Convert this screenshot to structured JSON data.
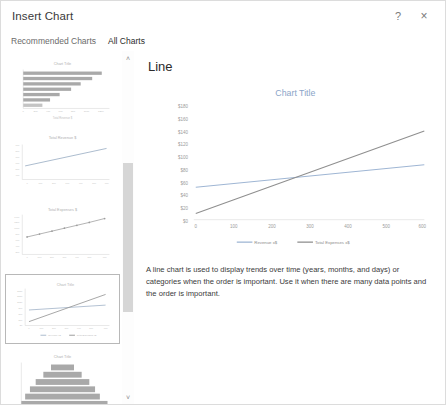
{
  "dialog": {
    "title": "Insert Chart",
    "help_label": "?",
    "close_label": "×"
  },
  "tabs": [
    {
      "label": "Recommended Charts",
      "active": false
    },
    {
      "label": "All Charts",
      "active": true
    }
  ],
  "scrollbar": {
    "up_label": "˄",
    "down_label": "˅"
  },
  "gallery": {
    "thumbnails": [
      {
        "name": "bar-chart-thumbnail",
        "title": "Chart Title",
        "selected": false
      },
      {
        "name": "line-chart-thumbnail",
        "title": "Total Revenue $",
        "selected": false
      },
      {
        "name": "line-markers-chart-thumbnail",
        "title": "Total Expenses $",
        "selected": false
      },
      {
        "name": "line-two-series-chart-thumbnail",
        "title": "Chart Title",
        "selected": true
      },
      {
        "name": "funnel-chart-thumbnail",
        "title": "Chart Title",
        "selected": false
      }
    ]
  },
  "preview": {
    "heading": "Line",
    "description": "A line chart is used to display trends over time (years, months, and days) or categories when the order is important. Use it when there are many data points and the order is important."
  },
  "chart_data": {
    "type": "line",
    "title": "Chart Title",
    "xlabel": "",
    "ylabel": "",
    "x": [
      0,
      100,
      200,
      300,
      400,
      500,
      600
    ],
    "xticklabels": [
      "0",
      "100",
      "200",
      "300",
      "400",
      "500",
      "600"
    ],
    "yticklabels": [
      "$180",
      "$160",
      "$140",
      "$120",
      "$100",
      "$80",
      "$60",
      "$40",
      "$20",
      "$0"
    ],
    "ylim": [
      0,
      180
    ],
    "xlim": [
      0,
      600
    ],
    "grid": false,
    "legend_position": "bottom",
    "series": [
      {
        "name": "Revenue x$",
        "color": "#9fb6d4",
        "values": [
          52,
          58,
          64,
          70,
          76,
          82,
          88
        ]
      },
      {
        "name": "Total Expenses x$",
        "color": "#8f8f8f",
        "values": [
          10,
          32,
          54,
          76,
          98,
          120,
          142
        ]
      }
    ]
  }
}
